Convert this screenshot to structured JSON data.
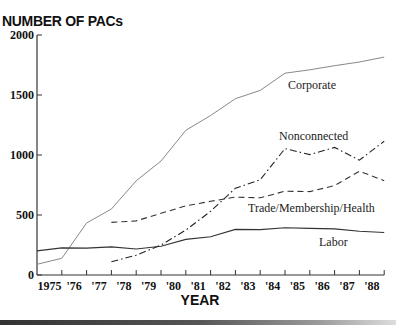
{
  "chart_data": {
    "type": "line",
    "title": "NUMBER OF PACs",
    "xlabel": "YEAR",
    "ylabel": "NUMBER OF PACs",
    "ylim": [
      0,
      2000
    ],
    "yticks": [
      0,
      500,
      1000,
      1500,
      2000
    ],
    "ytick_labels": [
      "0",
      "500",
      "1000",
      "1500",
      "2000"
    ],
    "x": [
      1974,
      1975,
      1976,
      1977,
      1978,
      1979,
      1980,
      1981,
      1982,
      1983,
      1984,
      1985,
      1986,
      1987,
      1988
    ],
    "xtick_labels": [
      "1975",
      "'76",
      "'77",
      "'78",
      "'79",
      "'80",
      "'81",
      "'82",
      "'83",
      "'84",
      "'85",
      "'86",
      "'87",
      "'88"
    ],
    "grid": false,
    "legend": "inline labels",
    "series": [
      {
        "name": "Corporate",
        "style": "solid-thin",
        "values": [
          89,
          139,
          433,
          550,
          785,
          950,
          1206,
          1329,
          1469,
          1538,
          1682,
          1710,
          1744,
          1775,
          1816
        ]
      },
      {
        "name": "Nonconnected",
        "style": "dash-dot",
        "values": [
          null,
          null,
          null,
          110,
          165,
          250,
          374,
          531,
          723,
          793,
          1053,
          1003,
          1063,
          957,
          1115
        ]
      },
      {
        "name": "Trade/Membership/Health",
        "style": "dashed",
        "values": [
          null,
          null,
          null,
          438,
          451,
          514,
          576,
          614,
          649,
          643,
          698,
          695,
          745,
          865,
          786
        ]
      },
      {
        "name": "Labor",
        "style": "solid",
        "values": [
          201,
          226,
          224,
          234,
          217,
          240,
          297,
          318,
          380,
          378,
          394,
          388,
          384,
          364,
          354
        ]
      }
    ]
  },
  "labels": {
    "title": "NUMBER OF PACs",
    "xaxis": "YEAR",
    "corporate": "Corporate",
    "nonconnected": "Nonconnected",
    "trade": "Trade/Membership/Health",
    "labor": "Labor"
  }
}
